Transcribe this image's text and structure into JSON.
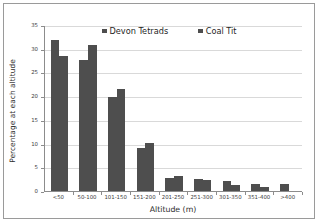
{
  "chart_data": {
    "type": "bar",
    "title": "",
    "xlabel": "Altitude (m)",
    "ylabel": "Percentage at each altitude",
    "ylim": [
      0,
      35
    ],
    "yticks": [
      0,
      5,
      10,
      15,
      20,
      25,
      30,
      35
    ],
    "ytick_labels": [
      "0",
      "5",
      "10",
      "15",
      "20",
      "25",
      "30",
      "35"
    ],
    "grid": true,
    "legend_position": "top-center",
    "categories": [
      "<50",
      "50-100",
      "101-150",
      "151-200",
      "201-250",
      "251-300",
      "301-350",
      "351-400",
      ">400"
    ],
    "series": [
      {
        "name": "Devon Tetrads",
        "color": "#4e4e4e",
        "values": [
          31.9,
          27.6,
          19.8,
          9.0,
          2.7,
          2.6,
          2.1,
          1.5,
          1.4
        ]
      },
      {
        "name": "Coal Tit",
        "color": "#4e4e4e",
        "values": [
          28.4,
          30.8,
          21.5,
          10.2,
          3.2,
          2.4,
          1.2,
          0.9,
          0.0
        ]
      }
    ]
  },
  "frame": {
    "border_color": "#9a9a9a",
    "background": "#ffffff"
  }
}
